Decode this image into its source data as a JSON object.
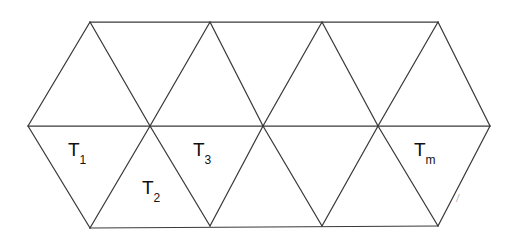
{
  "figure": {
    "type": "triangulated-strip-diagram",
    "background_color": "#ffffff",
    "stroke_color": "#3a3a3a",
    "label_color": "#111111",
    "width": 513,
    "height": 236
  },
  "labels": [
    {
      "id": "T1",
      "base": "T",
      "sub": "1",
      "x": 68,
      "y": 140
    },
    {
      "id": "T2",
      "base": "T",
      "sub": "2",
      "x": 142,
      "y": 178
    },
    {
      "id": "T3",
      "base": "T",
      "sub": "3",
      "x": 193,
      "y": 140
    },
    {
      "id": "Tm",
      "base": "T",
      "sub": "m",
      "x": 414,
      "y": 140
    }
  ],
  "geometry": {
    "left_apex": {
      "x": 28,
      "y": 126
    },
    "right_apex": {
      "x": 490,
      "y": 126
    },
    "top_vertices": [
      {
        "x": 90,
        "y": 22
      },
      {
        "x": 210,
        "y": 22
      },
      {
        "x": 322,
        "y": 22
      },
      {
        "x": 438,
        "y": 22
      }
    ],
    "bottom_vertices": [
      {
        "x": 90,
        "y": 228
      },
      {
        "x": 210,
        "y": 226
      },
      {
        "x": 322,
        "y": 226
      },
      {
        "x": 438,
        "y": 226
      }
    ],
    "mid_crossings": [
      {
        "x": 150,
        "y": 126
      },
      {
        "x": 263,
        "y": 126
      },
      {
        "x": 378,
        "y": 126
      }
    ],
    "edges": [
      {
        "name": "top-horizontal",
        "x1": 90,
        "y1": 22,
        "x2": 438,
        "y2": 22
      },
      {
        "name": "middle-horizontal",
        "x1": 28,
        "y1": 126,
        "x2": 490,
        "y2": 126
      },
      {
        "name": "bottom-horizontal",
        "x1": 90,
        "y1": 228,
        "x2": 438,
        "y2": 226
      },
      {
        "name": "left-upper-slant",
        "x1": 28,
        "y1": 126,
        "x2": 90,
        "y2": 22
      },
      {
        "name": "left-lower-slant",
        "x1": 28,
        "y1": 126,
        "x2": 90,
        "y2": 228
      },
      {
        "name": "right-upper-slant",
        "x1": 438,
        "y1": 22,
        "x2": 490,
        "y2": 126
      },
      {
        "name": "right-lower-slant",
        "x1": 490,
        "y1": 126,
        "x2": 438,
        "y2": 226
      },
      {
        "name": "up-right-1",
        "x1": 90,
        "y1": 22,
        "x2": 150,
        "y2": 126
      },
      {
        "name": "up-left-1",
        "x1": 210,
        "y1": 22,
        "x2": 150,
        "y2": 126
      },
      {
        "name": "up-right-2",
        "x1": 210,
        "y1": 22,
        "x2": 263,
        "y2": 126
      },
      {
        "name": "up-left-2",
        "x1": 322,
        "y1": 22,
        "x2": 263,
        "y2": 126
      },
      {
        "name": "up-right-3",
        "x1": 322,
        "y1": 22,
        "x2": 378,
        "y2": 126
      },
      {
        "name": "up-left-3",
        "x1": 438,
        "y1": 22,
        "x2": 378,
        "y2": 126
      },
      {
        "name": "down-right-1",
        "x1": 90,
        "y1": 228,
        "x2": 150,
        "y2": 126
      },
      {
        "name": "down-left-1",
        "x1": 210,
        "y1": 226,
        "x2": 150,
        "y2": 126
      },
      {
        "name": "down-right-2",
        "x1": 210,
        "y1": 226,
        "x2": 263,
        "y2": 126
      },
      {
        "name": "down-left-2",
        "x1": 322,
        "y1": 226,
        "x2": 263,
        "y2": 126
      },
      {
        "name": "down-right-3",
        "x1": 322,
        "y1": 226,
        "x2": 378,
        "y2": 126
      },
      {
        "name": "down-left-3",
        "x1": 438,
        "y1": 226,
        "x2": 378,
        "y2": 126
      }
    ]
  },
  "artifacts": {
    "stray_mark": {
      "glyph": "/",
      "x": 456,
      "y": 190
    }
  }
}
